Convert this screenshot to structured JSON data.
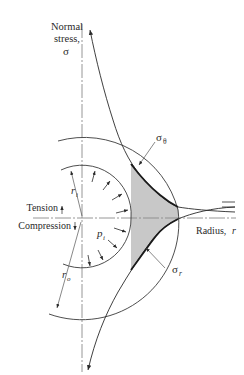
{
  "diagram": {
    "type": "thick-walled cylinder stress distribution",
    "axes": {
      "vertical_label_line1": "Normal",
      "vertical_label_line2": "stress,",
      "vertical_label_symbol": "σ",
      "horizontal_label": "Radius,",
      "horizontal_label_symbol": "r",
      "tension_label": "Tension",
      "compression_label": "Compression"
    },
    "curves": [
      {
        "name": "hoop stress",
        "label": "σ",
        "subscript": "θ",
        "region": "tension (above axis)"
      },
      {
        "name": "radial stress",
        "label": "σ",
        "subscript": "r",
        "region": "compression (below axis)"
      }
    ],
    "geometry": {
      "inner_radius_label": "r",
      "inner_radius_subscript": "i",
      "outer_radius_label": "r",
      "outer_radius_subscript": "o",
      "internal_pressure_label": "p",
      "internal_pressure_subscript": "i"
    },
    "colors": {
      "line": "#2a2a2a",
      "axis": "#8a8a8a",
      "shade": "#c8c8c8"
    }
  }
}
